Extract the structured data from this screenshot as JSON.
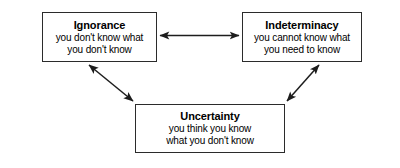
{
  "diagram": {
    "type": "cycle-relationship",
    "background_color": "#ffffff",
    "line_color": "#2b2b2b",
    "text_color": "#000000",
    "nodes": [
      {
        "id": "ignorance",
        "title": "Ignorance",
        "desc_line1": "you don't know what",
        "desc_line2": "you don't know",
        "position": "top-left"
      },
      {
        "id": "indeterminacy",
        "title": "Indeterminacy",
        "desc_line1": "you cannot know what",
        "desc_line2": "you need to know",
        "position": "top-right"
      },
      {
        "id": "uncertainty",
        "title": "Uncertainty",
        "desc_line1": "you think you know",
        "desc_line2": "what you don't know",
        "position": "bottom-center"
      }
    ],
    "connectors": [
      {
        "id": "ignorance-indeterminacy",
        "from": "ignorance",
        "to": "indeterminacy",
        "style": "double-headed",
        "orientation": "horizontal"
      },
      {
        "id": "ignorance-uncertainty",
        "from": "ignorance",
        "to": "uncertainty",
        "style": "double-headed",
        "orientation": "diagonal-down-right"
      },
      {
        "id": "uncertainty-indeterminacy",
        "from": "uncertainty",
        "to": "indeterminacy",
        "style": "double-headed",
        "orientation": "diagonal-up-right"
      }
    ]
  }
}
